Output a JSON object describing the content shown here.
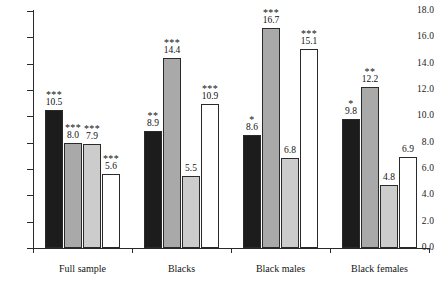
{
  "chart_data": {
    "type": "bar",
    "title": "",
    "subtitle": "",
    "xlabel": "",
    "ylabel": "",
    "ylim": [
      0.0,
      18.0
    ],
    "ytick_step": 2.0,
    "ytick_labels": [
      "0.0",
      "2.0",
      "4.0",
      "6.0",
      "8.0",
      "10.0",
      "12.0",
      "14.0",
      "16.0",
      "18.0"
    ],
    "ytick_values": [
      0.0,
      2.0,
      4.0,
      6.0,
      8.0,
      10.0,
      12.0,
      14.0,
      16.0,
      18.0
    ],
    "grid": false,
    "legend": "none",
    "categories": [
      "Full sample",
      "Blacks",
      "Black males",
      "Black females"
    ],
    "series": [
      {
        "name": "series-1",
        "fill": "black",
        "color": "#1c1c1c",
        "values": [
          10.5,
          8.9,
          8.6,
          9.8
        ],
        "labels": [
          "10.5",
          "8.9",
          "8.6",
          "9.8"
        ],
        "significance": [
          "***",
          "**",
          "*",
          "*"
        ]
      },
      {
        "name": "series-2",
        "fill": "mid",
        "color": "#a9a9a9",
        "values": [
          8.0,
          14.4,
          16.7,
          12.2
        ],
        "labels": [
          "8.0",
          "14.4",
          "16.7",
          "12.2"
        ],
        "significance": [
          "***",
          "***",
          "***",
          "**"
        ]
      },
      {
        "name": "series-3",
        "fill": "light",
        "color": "#cccccc",
        "values": [
          7.9,
          5.5,
          6.8,
          4.8
        ],
        "labels": [
          "7.9",
          "5.5",
          "6.8",
          "4.8"
        ],
        "significance": [
          "***",
          "",
          "",
          ""
        ]
      },
      {
        "name": "series-4",
        "fill": "white",
        "color": "#ffffff",
        "values": [
          5.6,
          10.9,
          15.1,
          6.9
        ],
        "labels": [
          "5.6",
          "10.9",
          "15.1",
          "6.9"
        ],
        "significance": [
          "***",
          "***",
          "***",
          ""
        ]
      }
    ]
  }
}
